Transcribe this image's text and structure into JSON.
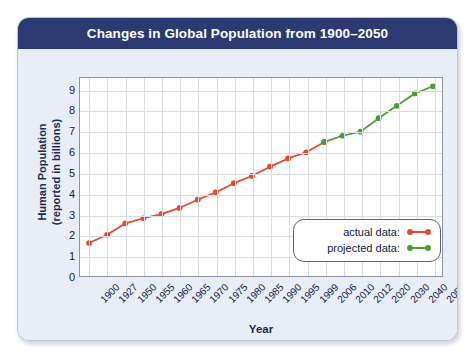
{
  "card": {
    "title": "Changes in Global Population from 1900–2050"
  },
  "chart_data": {
    "type": "line",
    "title": "Changes in Global Population from 1900–2050",
    "xlabel": "Year",
    "ylabel": "Human Population (reported in billions)",
    "ylabel_line1": "Human Population",
    "ylabel_line2": "(reported in billions)",
    "categories": [
      "1900",
      "1927",
      "1950",
      "1955",
      "1960",
      "1965",
      "1970",
      "1975",
      "1980",
      "1985",
      "1990",
      "1995",
      "1999",
      "2006",
      "2010",
      "2012",
      "2020",
      "2030",
      "2040",
      "2050"
    ],
    "yticks": [
      0,
      1,
      2,
      3,
      4,
      5,
      6,
      7,
      8,
      9
    ],
    "ylim": [
      0,
      9.6
    ],
    "grid": true,
    "legend_position": "bottom-right",
    "series": [
      {
        "name": "actual data:",
        "color": "#e8482a",
        "values": [
          1.6,
          2.0,
          2.55,
          2.8,
          3.0,
          3.3,
          3.7,
          4.05,
          4.5,
          4.85,
          5.3,
          5.7,
          6.0,
          6.5,
          null,
          null,
          null,
          null,
          null,
          null
        ]
      },
      {
        "name": "projected data:",
        "color": "#4a9c36",
        "values": [
          null,
          null,
          null,
          null,
          null,
          null,
          null,
          null,
          null,
          null,
          null,
          null,
          null,
          6.5,
          6.8,
          7.0,
          7.65,
          8.25,
          8.85,
          9.2
        ]
      }
    ]
  },
  "legend": {
    "items": [
      {
        "label": "actual data:",
        "color": "#e8482a"
      },
      {
        "label": "projected data:",
        "color": "#4a9c36"
      }
    ]
  }
}
